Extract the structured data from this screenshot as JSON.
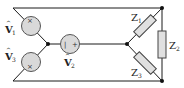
{
  "diagram": {
    "type": "three-phase circuit: Y-connected sources feeding Y-connected load",
    "colors": {
      "wire": "#1a1a1a",
      "source_fill": "#d9d9d9",
      "source_stroke": "#555555",
      "resistor_fill": "#e0e0e0",
      "resistor_stroke": "#444444",
      "node": "#111111"
    },
    "sources": [
      {
        "id": "v1",
        "symbol": "V",
        "hat": "^",
        "subscript": "1",
        "plus": "+",
        "minus": "−"
      },
      {
        "id": "v2",
        "symbol": "V",
        "hat": "^",
        "subscript": "2",
        "plus": "+",
        "minus": "−"
      },
      {
        "id": "v3",
        "symbol": "V",
        "hat": "^",
        "subscript": "3",
        "plus": "+",
        "minus": "−"
      }
    ],
    "impedances": [
      {
        "id": "z1",
        "symbol": "Z",
        "subscript": "1"
      },
      {
        "id": "z2",
        "symbol": "Z",
        "subscript": "2"
      },
      {
        "id": "z3",
        "symbol": "Z",
        "subscript": "3"
      }
    ]
  }
}
